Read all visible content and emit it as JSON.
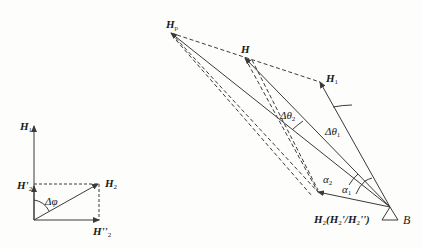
{
  "diagram": {
    "left": {
      "labels": {
        "h1": "H",
        "h1_sub": "1",
        "h2p": "H'",
        "h2p_sub": "2",
        "h2": "H",
        "h2_sub": "2",
        "h2pp": "H''",
        "h2pp_sub": "2",
        "dphi": "Δφ"
      }
    },
    "right": {
      "labels": {
        "hp": "H",
        "hp_sub": "p",
        "h": "H",
        "h1": "H",
        "h1_sub": "1",
        "dtheta2": "Δθ",
        "dtheta2_sub": "2",
        "dtheta1": "Δθ",
        "dtheta1_sub": "1",
        "alpha2": "α",
        "alpha2_sub": "2",
        "alpha1": "α",
        "alpha1_sub": "1",
        "h2_main": "H",
        "h2_sub": "2",
        "h2_paren": "(H",
        "h2_paren_sub1": "2",
        "h2_mid": "'/H",
        "h2_paren_sub2": "2",
        "h2_end": "'')",
        "b": "B"
      }
    },
    "colors": {
      "line": "#3a3a3a",
      "text": "#1a1a1a"
    }
  }
}
